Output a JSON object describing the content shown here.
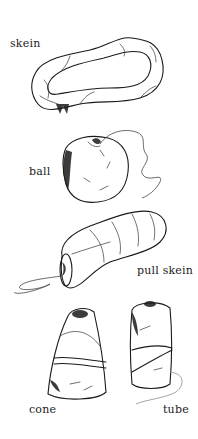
{
  "figure": {
    "background": "#ffffff",
    "ink_color": "#1a1a1a",
    "items": [
      {
        "id": "skein",
        "label": "skein"
      },
      {
        "id": "ball",
        "label": "ball"
      },
      {
        "id": "pull-skein",
        "label": "pull skein"
      },
      {
        "id": "cone",
        "label": "cone"
      },
      {
        "id": "tube",
        "label": "tube"
      }
    ]
  }
}
